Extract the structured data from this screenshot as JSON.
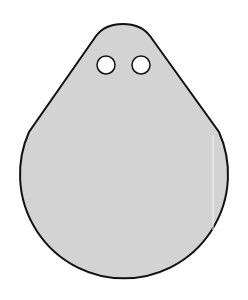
{
  "figure": {
    "colors": {
      "background": "#ffffff",
      "fill": "#d3d3d3",
      "stroke": "#111111",
      "hole_fill": "#ffffff"
    },
    "shape": {
      "body_circle": {
        "cx": 124,
        "cy": 181,
        "r": 104
      },
      "top_apex": {
        "x": 123,
        "y": 24
      }
    },
    "holes": [
      {
        "cx": 106,
        "cy": 65,
        "r": 9
      },
      {
        "cx": 141,
        "cy": 65,
        "r": 9
      }
    ]
  }
}
